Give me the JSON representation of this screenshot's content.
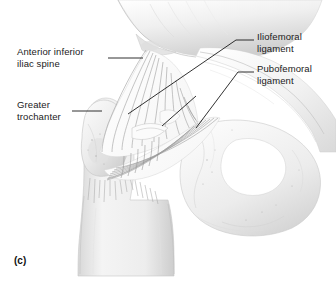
{
  "figure": {
    "caption": "(c)",
    "background_color": "#ffffff",
    "ink_color": "#1a1a1a",
    "style": "grayscale anatomical line drawing with stipple shading"
  },
  "labels": [
    {
      "id": "anterior-inferior-iliac-spine",
      "text": "Anterior inferior\niliac spine",
      "side": "left",
      "leader": "horizontal"
    },
    {
      "id": "greater-trochanter",
      "text": "Greater\ntrochanter",
      "side": "left",
      "leader": "horizontal"
    },
    {
      "id": "iliofemoral-ligament",
      "text": "Iliofemoral\nligament",
      "side": "right",
      "leader": "elbow-diagonal"
    },
    {
      "id": "pubofemoral-ligament",
      "text": "Pubofemoral\nligament",
      "side": "right",
      "leader": "elbow-diagonal"
    }
  ],
  "anatomy": {
    "structures": [
      "ilium",
      "anterior inferior iliac spine",
      "greater trochanter",
      "femoral shaft",
      "iliofemoral ligament",
      "pubofemoral ligament",
      "pubis",
      "ischium",
      "obturator foramen"
    ]
  }
}
